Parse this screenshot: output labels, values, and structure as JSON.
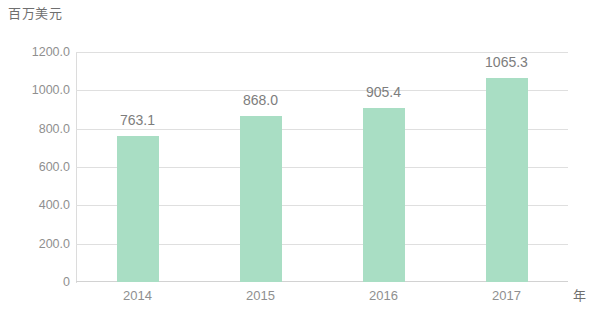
{
  "chart_data": {
    "type": "bar",
    "title": "",
    "subtitle": "",
    "xlabel": "年",
    "ylabel": "百万美元",
    "categories": [
      "2014",
      "2015",
      "2016",
      "2017"
    ],
    "values": [
      763.1,
      868.0,
      905.4,
      1065.3
    ],
    "value_labels": [
      "763.1",
      "868.0",
      "905.4",
      "1065.3"
    ],
    "series": [
      {
        "name": "",
        "values": [
          763.1,
          868.0,
          905.4,
          1065.3
        ]
      }
    ],
    "ylim": [
      0,
      1200
    ],
    "ytick_values": [
      0,
      200,
      400,
      600,
      800,
      1000,
      1200
    ],
    "ytick_labels": [
      "0",
      "200.0",
      "400.0",
      "600.0",
      "800.0",
      "1000.0",
      "1200.0"
    ],
    "grid": true,
    "grid_axis": "y",
    "legend": false,
    "legend_position": "none",
    "bar_color": "#a9dec4",
    "grid_color": "#dfdfdf",
    "text_color": "#8f8f8f",
    "background_color": "#ffffff"
  }
}
